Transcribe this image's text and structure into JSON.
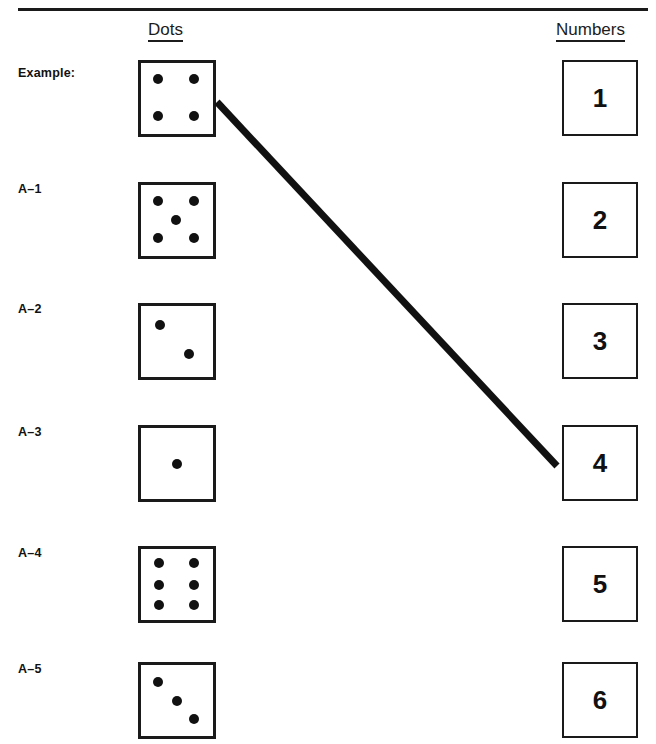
{
  "worksheet": {
    "headers": {
      "dots": "Dots",
      "numbers": "Numbers"
    },
    "rows": [
      {
        "label": "Example:",
        "dot_count": 4
      },
      {
        "label": "A–1",
        "dot_count": 5
      },
      {
        "label": "A–2",
        "dot_count": 2
      },
      {
        "label": "A–3",
        "dot_count": 1
      },
      {
        "label": "A–4",
        "dot_count": 6
      },
      {
        "label": "A–5",
        "dot_count": 3
      }
    ],
    "numbers": [
      "1",
      "2",
      "3",
      "4",
      "5",
      "6"
    ],
    "answer_line": {
      "from_row_label": "Example:",
      "to_number": "4",
      "x1": 217,
      "y1": 102,
      "x2": 557,
      "y2": 466,
      "stroke_width": 7,
      "color": "#111111"
    },
    "colors": {
      "ink": "#111111",
      "rule": "#1a1a1a",
      "paper": "#ffffff"
    },
    "dot_patterns": {
      "1": [
        [
          50,
          50
        ]
      ],
      "2": [
        [
          27,
          27
        ],
        [
          66,
          68
        ]
      ],
      "3": [
        [
          24,
          24
        ],
        [
          50,
          51
        ],
        [
          74,
          76
        ]
      ],
      "4": [
        [
          24,
          23
        ],
        [
          74,
          23
        ],
        [
          24,
          74
        ],
        [
          74,
          74
        ]
      ],
      "5": [
        [
          23,
          22
        ],
        [
          74,
          22
        ],
        [
          49,
          49
        ],
        [
          23,
          75
        ],
        [
          74,
          75
        ]
      ],
      "6": [
        [
          25,
          20
        ],
        [
          74,
          20
        ],
        [
          25,
          50
        ],
        [
          74,
          50
        ],
        [
          25,
          79
        ],
        [
          74,
          79
        ]
      ]
    }
  }
}
